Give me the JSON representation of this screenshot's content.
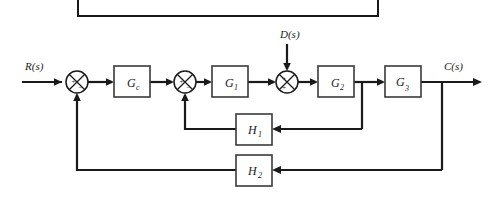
{
  "figure": {
    "kind": "control-system-block-diagram",
    "background_color": "#ffffff",
    "line_color": "#1a1a1a",
    "block_fill": "#ffffff",
    "block_border_color": "#3a3a3a"
  },
  "signals": {
    "input_label": "R(s)",
    "output_label": "C(s)",
    "disturbance_label": "D(s)"
  },
  "blocks": [
    {
      "id": "gc",
      "label": "G",
      "subscript": "c",
      "x": 114,
      "y": 66,
      "w": 36,
      "h": 31
    },
    {
      "id": "g1",
      "label": "G",
      "subscript": "1",
      "x": 212,
      "y": 66,
      "w": 36,
      "h": 31
    },
    {
      "id": "g2",
      "label": "G",
      "subscript": "2",
      "x": 318,
      "y": 66,
      "w": 36,
      "h": 31
    },
    {
      "id": "g3",
      "label": "G",
      "subscript": "3",
      "x": 385,
      "y": 66,
      "w": 36,
      "h": 31
    },
    {
      "id": "h1",
      "label": "H",
      "subscript": "1",
      "x": 236,
      "y": 114,
      "w": 36,
      "h": 31
    },
    {
      "id": "h2",
      "label": "H",
      "subscript": "2",
      "x": 236,
      "y": 155,
      "w": 36,
      "h": 31
    }
  ],
  "summing_junctions": [
    {
      "id": "sum1",
      "cx": 77,
      "cy": 82,
      "r": 11,
      "signs": [
        {
          "text": "+",
          "dx": -5.5,
          "dy": 2.0
        },
        {
          "text": "−",
          "dx": 1.5,
          "dy": 8.0
        }
      ]
    },
    {
      "id": "sum2",
      "cx": 185,
      "cy": 82,
      "r": 11,
      "signs": [
        {
          "text": "+",
          "dx": -5.5,
          "dy": 2.0
        },
        {
          "text": "−",
          "dx": 1.5,
          "dy": 8.0
        }
      ]
    },
    {
      "id": "sum3",
      "cx": 287,
      "cy": 82,
      "r": 11,
      "signs": [
        {
          "text": "+",
          "dx": -5.0,
          "dy": -1.5
        },
        {
          "text": "+",
          "dx": -5.0,
          "dy": 7.5
        }
      ]
    }
  ],
  "label_positions": {
    "input": {
      "x": 25,
      "y": 70
    },
    "output": {
      "x": 444,
      "y": 70
    },
    "disturbance": {
      "x": 280,
      "y": 38
    }
  },
  "frame_remnant": {
    "left_x": 78,
    "right_x": 378,
    "bottom_y": 16,
    "top_y": 0
  }
}
